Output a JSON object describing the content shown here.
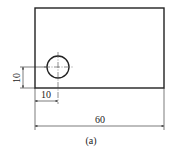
{
  "figure": {
    "caption": "(a)",
    "colors": {
      "stroke": "#222222",
      "background": "#ffffff"
    },
    "plate": {
      "width_label": "60"
    },
    "hole": {
      "x_offset_label": "10",
      "y_offset_label": "10"
    }
  }
}
